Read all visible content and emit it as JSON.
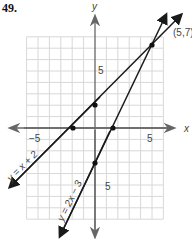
{
  "problem_number": "49.",
  "axes": {
    "x_label": "x",
    "y_label": "y",
    "tick_labels": {
      "x_neg": "−5",
      "x_pos": "5",
      "y_pos": "5",
      "y_neg": "5"
    }
  },
  "lines": [
    {
      "equation": "y = x + 2",
      "slope": 1,
      "intercept": 2
    },
    {
      "equation": "y = 2x − 3",
      "slope": 2,
      "intercept": -3
    }
  ],
  "intersection": {
    "label": "(5,7)",
    "x": 5,
    "y": 7
  },
  "marked_points": [
    {
      "x": 0,
      "y": 2
    },
    {
      "x": -2,
      "y": 0
    },
    {
      "x": 1.5,
      "y": 0
    },
    {
      "x": 0,
      "y": -3
    },
    {
      "x": 5,
      "y": 7
    }
  ],
  "colors": {
    "grid": "#d8d8d8",
    "axis": "#555555",
    "line": "#1a1a1a"
  }
}
